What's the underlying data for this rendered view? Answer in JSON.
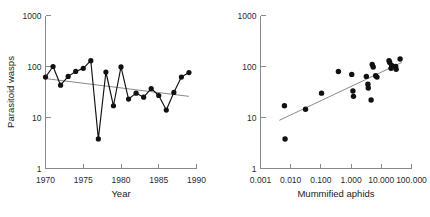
{
  "figure": {
    "panels": [
      "left",
      "right"
    ]
  },
  "chart_data": [
    {
      "id": "panel-a",
      "type": "line",
      "title": "",
      "xlabel": "Year",
      "ylabel": "Parasitoid wasps",
      "xscale": "linear",
      "yscale": "log",
      "xlim": [
        1970,
        1990
      ],
      "ylim": [
        1,
        1000
      ],
      "grid": false,
      "legend": "none",
      "xticks": [
        1970,
        1975,
        1980,
        1985,
        1990
      ],
      "xticklabels": [
        "1970",
        "1975",
        "1980",
        "1985",
        "1990"
      ],
      "yticks": [
        1,
        10,
        100,
        1000
      ],
      "yticklabels": [
        "1",
        "10",
        "100",
        "1000"
      ],
      "markers": "filled-circle",
      "series": [
        {
          "name": "Parasitoid wasps per year",
          "x": [
            1970,
            1971,
            1972,
            1973,
            1974,
            1975,
            1976,
            1977,
            1978,
            1979,
            1980,
            1981,
            1982,
            1983,
            1984,
            1985,
            1986,
            1987,
            1988,
            1989
          ],
          "y": [
            62,
            100,
            43,
            64,
            80,
            92,
            130,
            3.8,
            78,
            17,
            98,
            23,
            30,
            25,
            37,
            27,
            14,
            31,
            62,
            76
          ]
        }
      ],
      "trend": {
        "name": "regression line",
        "x": [
          1970,
          1989
        ],
        "y": [
          58,
          26
        ]
      }
    },
    {
      "id": "panel-b",
      "type": "scatter",
      "title": "",
      "xlabel": "Mummified aphids",
      "ylabel": "",
      "xscale": "log",
      "yscale": "log",
      "xlim": [
        0.001,
        100.0
      ],
      "ylim": [
        1,
        1000
      ],
      "grid": false,
      "legend": "none",
      "xticks": [
        0.001,
        0.01,
        0.1,
        1.0,
        10.0,
        100.0
      ],
      "xticklabels": [
        "0.001",
        "0.010",
        "0.100",
        "1.000",
        "10.000",
        "100.000"
      ],
      "yticks": [
        1,
        10,
        100,
        1000
      ],
      "yticklabels": [
        "1",
        "10",
        "100",
        "1000"
      ],
      "markers": "filled-circle",
      "points": [
        {
          "x": 0.0062,
          "y": 17
        },
        {
          "x": 0.0065,
          "y": 3.8
        },
        {
          "x": 0.031,
          "y": 14.5
        },
        {
          "x": 0.105,
          "y": 30
        },
        {
          "x": 0.38,
          "y": 80
        },
        {
          "x": 1.05,
          "y": 70
        },
        {
          "x": 1.15,
          "y": 33
        },
        {
          "x": 1.2,
          "y": 26
        },
        {
          "x": 3.2,
          "y": 64
        },
        {
          "x": 3.6,
          "y": 45
        },
        {
          "x": 3.7,
          "y": 38
        },
        {
          "x": 4.6,
          "y": 22
        },
        {
          "x": 5.0,
          "y": 110
        },
        {
          "x": 5.4,
          "y": 98
        },
        {
          "x": 6.5,
          "y": 66
        },
        {
          "x": 7.2,
          "y": 62
        },
        {
          "x": 18.0,
          "y": 130
        },
        {
          "x": 19.0,
          "y": 120
        },
        {
          "x": 21.0,
          "y": 92
        },
        {
          "x": 22.0,
          "y": 105
        },
        {
          "x": 30.0,
          "y": 100
        },
        {
          "x": 31.0,
          "y": 88
        },
        {
          "x": 42.0,
          "y": 140
        }
      ],
      "trend": {
        "name": "regression line",
        "x": [
          0.0042,
          48.0
        ],
        "y": [
          8.8,
          120
        ]
      }
    }
  ]
}
